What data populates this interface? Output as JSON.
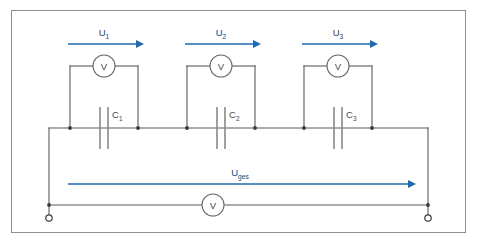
{
  "diagram": {
    "type": "electrical-circuit-schematic",
    "colors": {
      "arrow_blue": "#1c6ab0",
      "label_blue": "#14447c",
      "wire_gray": "#5a5a5a",
      "plate_gray": "#8a8a8a",
      "frame_gray": "#8d8d8d",
      "background": "#ffffff"
    },
    "frame": {
      "x": 11,
      "y": 10,
      "width": 455,
      "height": 223
    }
  },
  "branches": [
    {
      "id": "branch-1",
      "voltage_label": "U",
      "voltage_sub": "1",
      "capacitor_label": "C",
      "capacitor_sub": "1",
      "meter_label": "V",
      "arrow": {
        "x1": 68,
        "x2": 142,
        "y": 44
      },
      "voltage_text_x": 104,
      "voltage_text_y": 38,
      "meter_cx": 104,
      "meter_cy": 66,
      "meter_r": 11,
      "left_x": 70,
      "right_x": 138,
      "cap_x": 104,
      "cap_label_x": 110,
      "cap_label_y": 118
    },
    {
      "id": "branch-2",
      "voltage_label": "U",
      "voltage_sub": "2",
      "capacitor_label": "C",
      "capacitor_sub": "2",
      "meter_label": "V",
      "arrow": {
        "x1": 185,
        "x2": 259,
        "y": 44
      },
      "voltage_text_x": 221,
      "voltage_text_y": 38,
      "meter_cx": 221,
      "meter_cy": 66,
      "meter_r": 11,
      "left_x": 187,
      "right_x": 255,
      "cap_x": 221,
      "cap_label_x": 227,
      "cap_label_y": 118
    },
    {
      "id": "branch-3",
      "voltage_label": "U",
      "voltage_sub": "3",
      "capacitor_label": "C",
      "capacitor_sub": "3",
      "meter_label": "V",
      "arrow": {
        "x1": 302,
        "x2": 376,
        "y": 44
      },
      "voltage_text_x": 338,
      "voltage_text_y": 38,
      "meter_cx": 338,
      "meter_cy": 66,
      "meter_r": 11,
      "left_x": 304,
      "right_x": 372,
      "cap_x": 338,
      "cap_label_x": 344,
      "cap_label_y": 118
    }
  ],
  "total": {
    "id": "total-branch",
    "voltage_label": "U",
    "voltage_sub": "ges",
    "meter_label": "V",
    "arrow": {
      "x1": 68,
      "x2": 414,
      "y": 184
    },
    "voltage_text_x": 240,
    "voltage_text_y": 177,
    "meter_cx": 213,
    "meter_cy": 205,
    "meter_r": 11
  },
  "rails": {
    "main_y": 128,
    "main_x1": 49,
    "main_x2": 428,
    "bottom_y": 205,
    "left_x": 49,
    "right_x": 428,
    "terminal_left": {
      "cx": 49,
      "cy": 218,
      "r": 3.2
    },
    "terminal_right": {
      "cx": 428,
      "cy": 218,
      "r": 3.2
    }
  },
  "nodes": [
    {
      "x": 70,
      "y": 128
    },
    {
      "x": 138,
      "y": 128
    },
    {
      "x": 187,
      "y": 128
    },
    {
      "x": 255,
      "y": 128
    },
    {
      "x": 304,
      "y": 128
    },
    {
      "x": 372,
      "y": 128
    },
    {
      "x": 49,
      "y": 205
    },
    {
      "x": 428,
      "y": 205
    }
  ]
}
